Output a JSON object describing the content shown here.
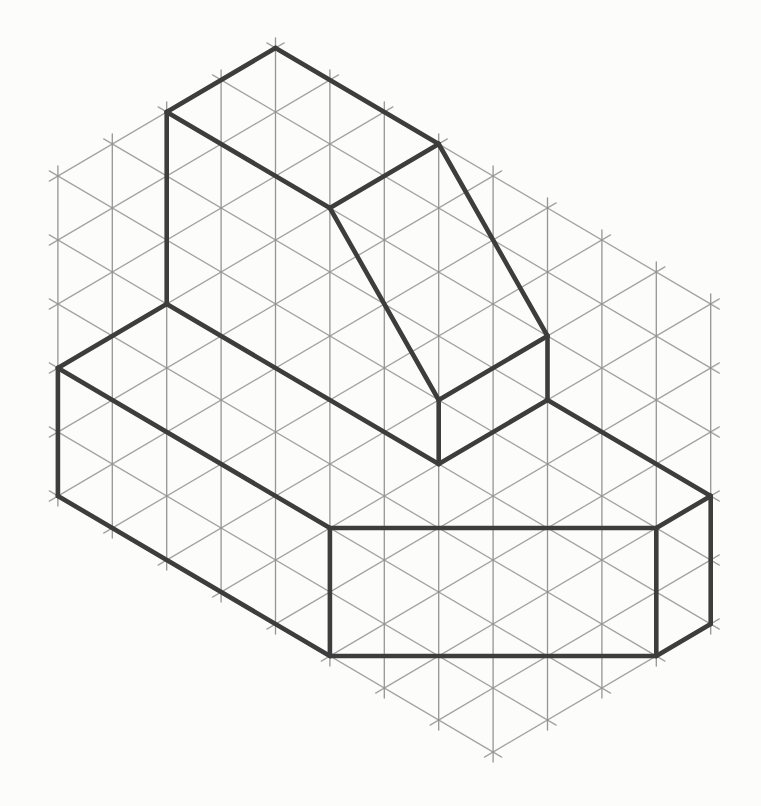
{
  "figure": {
    "canvas": {
      "width": 761,
      "height": 806,
      "background": "#fcfcfb"
    },
    "grid": {
      "diagonal_color": "#9d9d9d",
      "vertical_color": "#8f8f8f",
      "stroke_width": 1.3,
      "opacity": 0.95,
      "overshoot": 10,
      "step_x": 54.4,
      "rise": 32,
      "unit_height": 64,
      "origin_x": 275.5,
      "origin_y": 48,
      "vertical_x0": 57.9,
      "vertical_count": 13,
      "r_line_count": 10,
      "l_line_count": 14,
      "hexagon": [
        [
          275.5,
          48
        ],
        [
          710.7,
          304
        ],
        [
          710.7,
          624
        ],
        [
          493.1,
          752
        ],
        [
          57.9,
          496
        ],
        [
          57.9,
          176
        ]
      ]
    },
    "solid": {
      "color": "#3d3d3d",
      "stroke_width": 4.6,
      "vertices": {
        "A": [
          275.5,
          48
        ],
        "B": [
          166.7,
          112
        ],
        "C": [
          438.7,
          144
        ],
        "E": [
          329.9,
          208
        ],
        "F": [
          166.7,
          304
        ],
        "G": [
          57.9,
          368
        ],
        "H": [
          57.9,
          496
        ],
        "G5": [
          329.9,
          528
        ],
        "H5": [
          329.9,
          656
        ],
        "CT": [
          656.3,
          528
        ],
        "X1": [
          656.3,
          656
        ],
        "EP": [
          438.7,
          400
        ],
        "D": [
          547.5,
          336
        ],
        "V2": [
          438.7,
          464
        ],
        "V4": [
          547.5,
          400
        ],
        "W1": [
          710.7,
          496
        ],
        "W2": [
          710.7,
          624
        ]
      },
      "edges": [
        [
          "A",
          "B"
        ],
        [
          "A",
          "C"
        ],
        [
          "B",
          "E"
        ],
        [
          "C",
          "E"
        ],
        [
          "B",
          "F"
        ],
        [
          "F",
          "G"
        ],
        [
          "G",
          "H"
        ],
        [
          "F",
          "V2"
        ],
        [
          "E",
          "EP"
        ],
        [
          "C",
          "D"
        ],
        [
          "EP",
          "D"
        ],
        [
          "EP",
          "V2"
        ],
        [
          "D",
          "V4"
        ],
        [
          "V2",
          "V4"
        ],
        [
          "G",
          "G5"
        ],
        [
          "H",
          "H5"
        ],
        [
          "G5",
          "H5"
        ],
        [
          "G5",
          "CT"
        ],
        [
          "H5",
          "X1"
        ],
        [
          "CT",
          "X1"
        ],
        [
          "CT",
          "W1"
        ],
        [
          "V4",
          "W1"
        ],
        [
          "W1",
          "W2"
        ],
        [
          "W2",
          "X1"
        ]
      ]
    }
  }
}
